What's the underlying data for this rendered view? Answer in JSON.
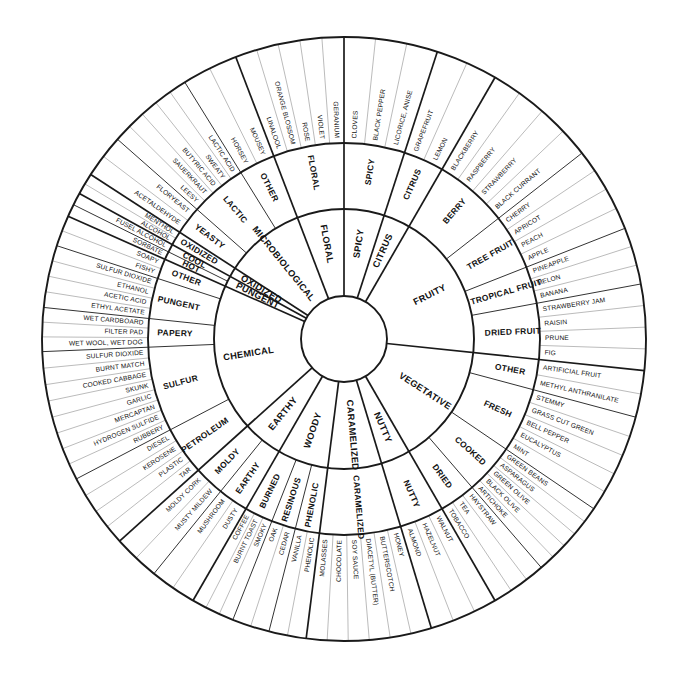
{
  "wheel": {
    "title": "Wine Aroma Wheel",
    "geometry": {
      "cx": 344,
      "cy": 339,
      "r_hub": 43,
      "r_inner_out": 130,
      "r_mid_out": 196,
      "r_outer_out": 302,
      "start_angle_deg": -90
    },
    "colors": {
      "stroke_heavy": "#1a1a1a",
      "stroke_light": "#777777",
      "background": "#ffffff",
      "text": "#111111"
    },
    "categories": [
      {
        "name": "SPICY",
        "span": 30,
        "subcategories": [
          {
            "name": "SPICY",
            "span": 30,
            "terms": [
              "CLOVES",
              "BLACK PEPPER",
              "LICORICE, ANISE"
            ]
          }
        ]
      },
      {
        "name": "CITRUS",
        "span": 20,
        "subcategories": [
          {
            "name": "CITRUS",
            "span": 20,
            "terms": [
              "GRAPEFRUIT",
              "LEMON"
            ]
          }
        ]
      },
      {
        "name": "FRUITY",
        "span": 110,
        "subcategories": [
          {
            "name": "BERRY",
            "span": 40,
            "terms": [
              "BLACKBERRY",
              "RASPBERRY",
              "STRAWBERRY",
              "BLACK CURRANT"
            ]
          },
          {
            "name": "TREE FRUIT",
            "span": 30,
            "terms": [
              "CHERRY",
              "APRICOT",
              "PEACH",
              "APPLE"
            ]
          },
          {
            "name": "TROPICAL FRUIT",
            "span": 20,
            "terms": [
              "PINEAPPLE",
              "MELON",
              "BANANA"
            ]
          },
          {
            "name": "DRIED FRUIT",
            "span": 30,
            "terms": [
              "STRAWBERRY JAM",
              "RAISIN",
              "PRUNE",
              "FIG"
            ]
          }
        ]
      },
      {
        "name": "VEGETATIVE",
        "span": 90,
        "subcategories": [
          {
            "name": "OTHER",
            "span": 15,
            "terms": [
              "ARTIFICIAL FRUIT",
              "METHYL ANTHRANILATE"
            ]
          },
          {
            "name": "FRESH",
            "span": 32,
            "terms": [
              "STEMMY",
              "GRASS CUT GREEN",
              "BELL PEPPER",
              "EUCALYPTUS",
              "MINT"
            ]
          },
          {
            "name": "COOKED",
            "span": 25,
            "terms": [
              "GREEN BEANS",
              "ASPARAGUS",
              "GREEN OLIVE",
              "BLACK OLIVE",
              "ARTICHOKE"
            ]
          },
          {
            "name": "DRIED",
            "span": 18,
            "terms": [
              "HAYSTRAW",
              "TEA",
              "TOBACCO"
            ]
          }
        ]
      },
      {
        "name": "NUTTY",
        "span": 22,
        "subcategories": [
          {
            "name": "NUTTY",
            "span": 22,
            "terms": [
              "WALNUT",
              "HAZELNUT",
              "ALMOND"
            ]
          }
        ]
      },
      {
        "name": "CARAMELIZED",
        "span": 40,
        "subcategories": [
          {
            "name": "CARAMELIZED",
            "span": 40,
            "terms": [
              "HONEY",
              "BUTTERSCOTCH",
              "DIACETYL (BUTTER)",
              "SOY SAUCE",
              "CHOCOLATE",
              "MOLASSES"
            ]
          }
        ]
      },
      {
        "name": "WOODY",
        "span": 38,
        "subcategories": [
          {
            "name": "PHENOLIC",
            "span": 12,
            "terms": [
              "PHENOLIC",
              "VANILLA"
            ]
          },
          {
            "name": "RESINOUS",
            "span": 12,
            "terms": [
              "CEDAR",
              "OAK"
            ]
          },
          {
            "name": "BURNED",
            "span": 14,
            "terms": [
              "SMOKY",
              "BURNT TOAST",
              "COFFEE"
            ]
          }
        ]
      },
      {
        "name": "EARTHY",
        "span": 30,
        "subcategories": [
          {
            "name": "EARTHY",
            "span": 15,
            "terms": [
              "DUSTY",
              "MUSHROOM"
            ]
          },
          {
            "name": "MOLDY",
            "span": 15,
            "terms": [
              "MUSTY MILDEW",
              "MOLDY CORK"
            ]
          }
        ]
      },
      {
        "name": "CHEMICAL",
        "span": 110,
        "subcategories": [
          {
            "name": "PETROLEUM",
            "span": 24,
            "terms": [
              "TAR",
              "PLASTIC",
              "KEROSENE",
              "DIESEL"
            ]
          },
          {
            "name": "SULFUR",
            "span": 42,
            "terms": [
              "RUBBERY",
              "HYDROGEN SULFIDE",
              "MERCAPTAN",
              "GARLIC",
              "SKUNK",
              "COOKED CABBAGE",
              "BURNT MATCH",
              "SULFUR DIOXIDE"
            ]
          },
          {
            "name": "PAPERY",
            "span": 14,
            "terms": [
              "WET WOOL, WET DOG",
              "FILTER PAD",
              "WET CARDBOARD"
            ]
          },
          {
            "name": "PUNGENT",
            "span": 20,
            "terms": [
              "ETHYL ACETATE",
              "ACETIC ACID",
              "ETHANOL",
              "SULFUR DIOXIDE"
            ]
          },
          {
            "name": "OTHER",
            "span": 10,
            "terms": [
              "FISHY",
              "SOAPY"
            ]
          }
        ]
      },
      {
        "name": "PUNGENT",
        "span": 8,
        "subcategories": [
          {
            "name": "HOT",
            "span": 4,
            "terms": [
              "SORBATE"
            ]
          },
          {
            "name": "COOL",
            "span": 4,
            "terms": [
              "FUSEL ALCOHOL"
            ]
          }
        ]
      },
      {
        "name": "OXIDIZED",
        "span": 7,
        "subcategories": [
          {
            "name": "OXIDIZED",
            "span": 7,
            "terms": [
              "ALCOHOL",
              "MENTHOL"
            ]
          }
        ]
      },
      {
        "name": "MICROBIOLOGICAL",
        "span": 60,
        "subcategories": [
          {
            "name": "YEASTY",
            "span": 14,
            "terms": [
              "ACETALDEHYDE",
              "FLORYEAST"
            ]
          },
          {
            "name": "LACTIC",
            "span": 28,
            "terms": [
              "LEESY",
              "SAUERKRAUT",
              "BUTYRIC ACID",
              "SWEATY",
              "LACTIC ACID"
            ]
          },
          {
            "name": "OTHER",
            "span": 18,
            "terms": [
              "HORSEY",
              "MOUSEY"
            ]
          }
        ]
      },
      {
        "name": "FLORAL",
        "span": 35,
        "subcategories": [
          {
            "name": "FLORAL",
            "span": 35,
            "terms": [
              "LINALOOL",
              "ORANGE BLOSSOM",
              "ROSE",
              "VIOLET",
              "GERANIUM"
            ]
          }
        ]
      }
    ]
  }
}
